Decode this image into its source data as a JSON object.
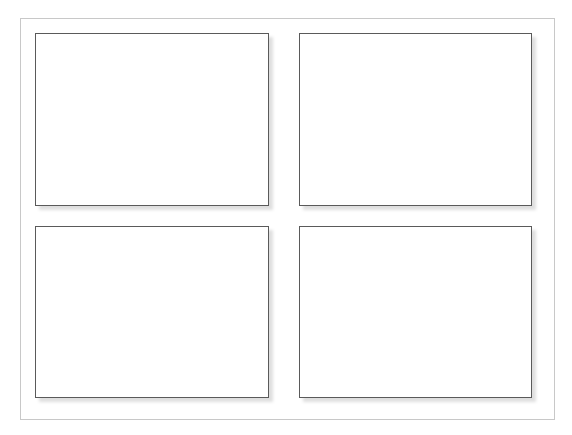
{
  "layout": {
    "frame": {
      "label": ""
    },
    "panels": [
      {
        "id": "top-left",
        "content": ""
      },
      {
        "id": "top-right",
        "content": ""
      },
      {
        "id": "bottom-left",
        "content": ""
      },
      {
        "id": "bottom-right",
        "content": ""
      }
    ]
  },
  "colors": {
    "frame_border": "#c8c8c8",
    "panel_border": "#5a5a5a",
    "background": "#ffffff"
  }
}
